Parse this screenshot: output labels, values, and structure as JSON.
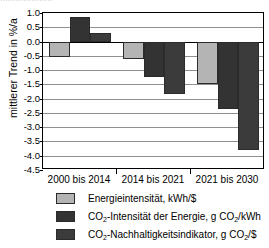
{
  "title_remnant": "....................",
  "chart_data": {
    "type": "bar",
    "title": "",
    "xlabel": "",
    "ylabel": "mittlerer Trend in %/a",
    "categories": [
      "2000 bis 2014",
      "2014 bis 2021",
      "2021 bis 2030"
    ],
    "ylim": [
      -4.5,
      1.0
    ],
    "ytick_step": 0.5,
    "ytick_labels": [
      "1.0",
      "0.5",
      "0.0",
      "-0.5",
      "-1.0",
      "-1.5",
      "-2.0",
      "-2.5",
      "-3.0",
      "-3.5",
      "-4.0",
      "-4.5"
    ],
    "ytick_values": [
      1.0,
      0.5,
      0.0,
      -0.5,
      -1.0,
      -1.5,
      -2.0,
      -2.5,
      -3.0,
      -3.5,
      -4.0,
      -4.5
    ],
    "grid": true,
    "legend_position": "bottom-left",
    "series": [
      {
        "name": "Energieintensität, kWh/$",
        "color": "#b4b4b4",
        "values": [
          -0.55,
          -0.62,
          -1.5
        ]
      },
      {
        "name": "CO2-Intensität der Energie, g CO2/kWh",
        "color": "#333333",
        "values": [
          0.86,
          -1.25,
          -2.38
        ]
      },
      {
        "name": "CO2-Nachhaltigkeitsindikator, g CO2/$",
        "color": "#3b3b3b",
        "values": [
          0.29,
          -1.85,
          -3.8
        ]
      }
    ]
  },
  "legend": [
    {
      "swatch_color": "#b4b4b4",
      "label_pre": "Energieintensität, kWh/$",
      "label_sub1": "",
      "label_mid": "",
      "label_sub2": "",
      "label_post": ""
    },
    {
      "swatch_color": "#333333",
      "label_pre": "CO",
      "label_sub1": "2",
      "label_mid": "-Intensität der Energie, g CO",
      "label_sub2": "2",
      "label_post": "/kWh"
    },
    {
      "swatch_color": "#3b3b3b",
      "label_pre": "CO",
      "label_sub1": "2",
      "label_mid": "-Nachhaltigkeitsindikator, g CO",
      "label_sub2": "2",
      "label_post": "/$"
    }
  ]
}
